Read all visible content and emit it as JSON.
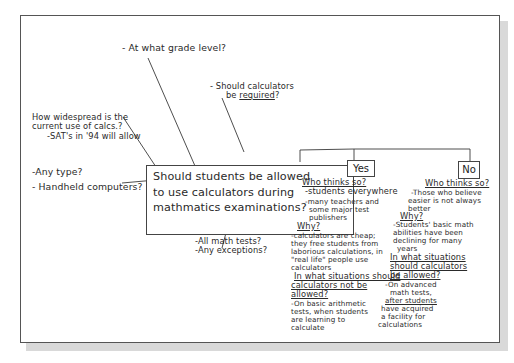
{
  "diagram": {
    "central_question": [
      "Should students be allowed",
      "to use calculators during",
      "mathmatics examinations?"
    ],
    "branches": {
      "grade_level": "- At what grade level?",
      "required": [
        "- Should calculators",
        "be required?"
      ],
      "required_underlined_word": "required",
      "widespread": [
        "How widespread is the",
        "current use of calcs.?",
        "-SAT's in '94 will allow"
      ],
      "type": [
        "-Any type?",
        "- Handheld computers?"
      ],
      "tests": [
        "-All math tests?",
        "-Any exceptions?"
      ]
    },
    "yes": {
      "label": "Yes",
      "who_heading": "Who thinks so?",
      "who_items": [
        "-students everywhere",
        "-many teachers and",
        "some major test",
        "publishers"
      ],
      "why_heading": "Why?",
      "why_text": [
        "-calculators are cheap;",
        "they free students from",
        "laborious calculations, in",
        "\"real life\" people use",
        "calculators"
      ],
      "situations_heading": [
        "In what situations should",
        "calculators not be",
        "allowed?"
      ],
      "situations_text": [
        "-On basic arithmetic",
        "tests, when students",
        "are learning to",
        "calculate"
      ]
    },
    "no": {
      "label": "No",
      "who_heading": "Who thinks so?",
      "who_items": [
        "-Those who believe",
        "easier is not always",
        "better"
      ],
      "why_heading": "Why?",
      "why_text": [
        "-Students' basic math",
        "abilities have been",
        "declining for many",
        "years"
      ],
      "situations_heading": [
        "In what situations",
        "should calculators",
        "be allowed?"
      ],
      "situations_text": [
        "-On advanced",
        "math tests,",
        "after students",
        "have acquired",
        "a facility for",
        "calculations"
      ]
    }
  },
  "colors": {
    "ink": "#2a2a2a",
    "frame_border": "#555555",
    "shadow": "#d9d9d9",
    "background": "#ffffff"
  }
}
